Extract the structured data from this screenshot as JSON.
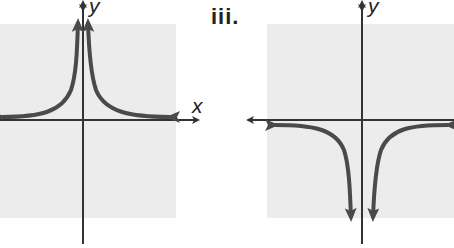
{
  "figures": [
    {
      "id": "left",
      "label": "",
      "axis_labels": {
        "x": "x",
        "y": "y"
      },
      "description": "Graph with both branches approaching +infinity near the y-axis and approaching the x-axis (from above) as |x| grows",
      "equation_form": "y = 1/x^2"
    },
    {
      "id": "right",
      "label": "iii.",
      "axis_labels": {
        "x": "",
        "y": "y"
      },
      "description": "Graph with both branches approaching -infinity near the y-axis and approaching the x-axis (from below) as |x| grows",
      "equation_form": "y = -1/x^2"
    }
  ],
  "colors": {
    "background_square": "#ececec",
    "curve": "#4a4a4a",
    "axis": "#333333"
  }
}
